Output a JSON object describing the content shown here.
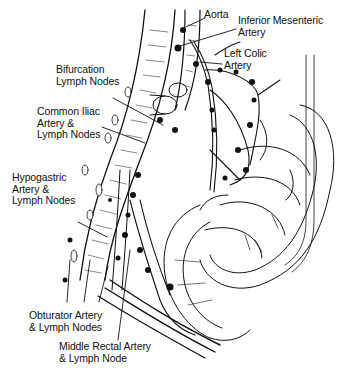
{
  "figure": {
    "type": "anatomical-illustration",
    "colors": {
      "ink": "#111111",
      "background": "#ffffff"
    }
  },
  "labels": {
    "aorta": {
      "lines": [
        "Aorta"
      ]
    },
    "inferior_mesenteric": {
      "lines": [
        "Inferior Mesenteric",
        "Artery"
      ]
    },
    "left_colic": {
      "lines": [
        "Left Colic",
        "Artery"
      ]
    },
    "bifurcation": {
      "lines": [
        "Bifurcation",
        "Lymph Nodes"
      ]
    },
    "common_iliac": {
      "lines": [
        "Common Iliac",
        "Artery &",
        "Lymph Nodes"
      ]
    },
    "hypogastric": {
      "lines": [
        "Hypogastric",
        "Artery &",
        "Lymph Nodes"
      ]
    },
    "obturator": {
      "lines": [
        "Obturator Artery",
        "& Lymph Nodes"
      ]
    },
    "middle_rectal": {
      "lines": [
        "Middle Rectal Artery",
        "& Lymph Node"
      ]
    }
  }
}
